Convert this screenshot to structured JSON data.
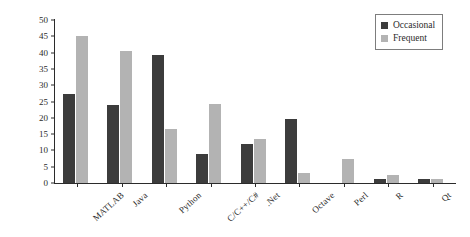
{
  "chart_data": {
    "type": "bar",
    "title": "",
    "xlabel": "",
    "ylabel": "Percentage",
    "ylim": [
      0,
      50
    ],
    "ytick_step": 5,
    "yticks": [
      0,
      5,
      10,
      15,
      20,
      25,
      30,
      35,
      40,
      45,
      50
    ],
    "grid": false,
    "legend_position": "top-right",
    "categories": [
      "MATLAB",
      "Java",
      "Python",
      "C/C++/C#",
      ".Net",
      "Octave",
      "Perl",
      "R",
      "Qt"
    ],
    "series": [
      {
        "name": "Occasional",
        "color": "#3c3c3c",
        "values": [
          27.2,
          24.0,
          39.2,
          9.0,
          12.0,
          19.5,
          0,
          1.3,
          1.3
        ]
      },
      {
        "name": "Frequent",
        "color": "#b3b3b3",
        "values": [
          45.0,
          40.6,
          16.6,
          24.3,
          13.6,
          3.0,
          7.3,
          2.6,
          1.3
        ]
      }
    ]
  },
  "legend": {
    "items": [
      {
        "label": "Occasional",
        "swatch": "occasional"
      },
      {
        "label": "Frequent",
        "swatch": "frequent"
      }
    ]
  },
  "colors": {
    "occasional": "#3c3c3c",
    "frequent": "#b3b3b3",
    "axis": "#2b2b2b",
    "background": "#ffffff"
  }
}
